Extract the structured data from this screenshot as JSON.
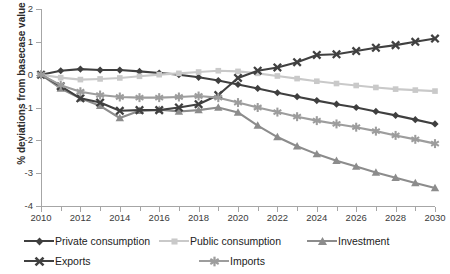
{
  "chart_data": {
    "type": "line",
    "title": "",
    "xlabel": "",
    "ylabel": "% deviations from basecase value",
    "xlim": [
      2010,
      2030
    ],
    "ylim": [
      -4,
      2
    ],
    "ytick_step": 1,
    "xtick_step": 2,
    "grid": false,
    "legend_position": "bottom",
    "x": [
      2010,
      2011,
      2012,
      2013,
      2014,
      2015,
      2016,
      2017,
      2018,
      2019,
      2020,
      2021,
      2022,
      2023,
      2024,
      2025,
      2026,
      2027,
      2028,
      2029,
      2030
    ],
    "ytick_labels": [
      "2",
      "1",
      "0",
      "-1",
      "-2",
      "-3",
      "-4"
    ],
    "xtick_labels": [
      "2010",
      "2012",
      "2014",
      "2016",
      "2018",
      "2020",
      "2022",
      "2024",
      "2026",
      "2028",
      "2030"
    ],
    "series": [
      {
        "name": "Private consumption",
        "marker": "diamond",
        "color": "#3f3f3f",
        "values": [
          0.0,
          0.12,
          0.17,
          0.14,
          0.14,
          0.1,
          0.05,
          0.0,
          -0.08,
          -0.18,
          -0.3,
          -0.42,
          -0.55,
          -0.67,
          -0.79,
          -0.9,
          -1.0,
          -1.12,
          -1.24,
          -1.37,
          -1.5
        ]
      },
      {
        "name": "Public consumption",
        "marker": "square",
        "color": "#c9c9c9",
        "values": [
          0.0,
          -0.09,
          -0.15,
          -0.13,
          -0.1,
          -0.05,
          0.0,
          0.04,
          0.08,
          0.12,
          0.1,
          0.04,
          -0.04,
          -0.12,
          -0.2,
          -0.27,
          -0.33,
          -0.39,
          -0.44,
          -0.47,
          -0.5
        ]
      },
      {
        "name": "Investment",
        "marker": "triangle",
        "color": "#8c8c8c",
        "values": [
          0.0,
          -0.42,
          -0.72,
          -0.95,
          -1.32,
          -1.1,
          -1.07,
          -1.12,
          -1.08,
          -1.0,
          -1.15,
          -1.55,
          -1.9,
          -2.18,
          -2.42,
          -2.62,
          -2.8,
          -2.98,
          -3.14,
          -3.3,
          -3.45
        ]
      },
      {
        "name": "Exports",
        "marker": "x",
        "color": "#404040",
        "values": [
          0.0,
          -0.35,
          -0.72,
          -0.85,
          -1.1,
          -1.08,
          -1.08,
          -1.0,
          -0.9,
          -0.62,
          -0.1,
          0.12,
          0.22,
          0.38,
          0.6,
          0.62,
          0.72,
          0.82,
          0.9,
          1.0,
          1.1
        ]
      },
      {
        "name": "Imports",
        "marker": "asterisk",
        "color": "#9d9d9d",
        "values": [
          0.0,
          -0.32,
          -0.52,
          -0.62,
          -0.68,
          -0.7,
          -0.7,
          -0.68,
          -0.65,
          -0.7,
          -0.85,
          -1.0,
          -1.14,
          -1.28,
          -1.4,
          -1.5,
          -1.6,
          -1.72,
          -1.85,
          -1.97,
          -2.1
        ]
      }
    ]
  },
  "legend": {
    "rows": [
      [
        "Private consumption",
        "Public consumption",
        "Investment"
      ],
      [
        "Exports",
        "Imports"
      ]
    ]
  }
}
